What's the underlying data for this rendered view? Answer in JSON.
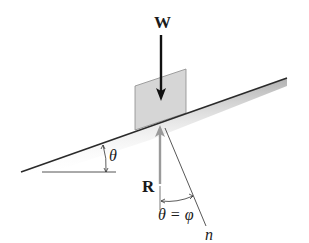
{
  "diagram": {
    "type": "free-body diagram of block on inclined plane",
    "labels": {
      "weight": "W",
      "reaction": "R",
      "incline_angle": "θ",
      "friction_angle": "θ = φ",
      "normal": "n"
    },
    "colors": {
      "line": "#2a2a2a",
      "block_fill": "#d6d6d6",
      "block_stroke": "#8a8a8a",
      "reaction_arrow": "#9a9a9a",
      "weight_arrow": "#111111",
      "shadow": "#bdbdbd"
    }
  }
}
